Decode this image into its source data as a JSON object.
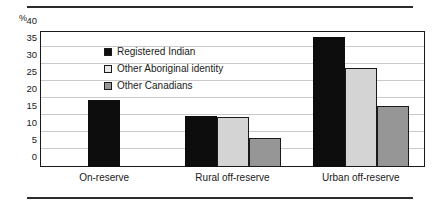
{
  "chart_data": {
    "type": "bar",
    "title": "",
    "subtitle": "",
    "xlabel": "",
    "ylabel": "%",
    "ylim": [
      0,
      40
    ],
    "yticks": [
      0,
      5,
      10,
      15,
      20,
      25,
      30,
      35,
      40
    ],
    "ytick_labels": [
      "0",
      "5",
      "10",
      "15",
      "20",
      "25",
      "30",
      "35",
      "40"
    ],
    "grid": true,
    "legend_position": "inside-upper-left",
    "categories": [
      "On-reserve",
      "Rural off-reserve",
      "Urban off-reserve"
    ],
    "series": [
      {
        "name": "Registered Indian",
        "color": "#0d0d0d",
        "values": [
          19.8,
          15.0,
          38.2
        ]
      },
      {
        "name": "Other Aboriginal identity",
        "color": "#d4d4d4",
        "values": [
          null,
          14.8,
          29.0
        ]
      },
      {
        "name": "Other Canadians",
        "color": "#969696",
        "values": [
          null,
          8.6,
          17.8
        ]
      }
    ]
  },
  "legend": {
    "items": [
      {
        "label": "Registered Indian"
      },
      {
        "label": "Other Aboriginal identity"
      },
      {
        "label": "Other Canadians"
      }
    ]
  },
  "axes": {
    "unit_label": "%"
  }
}
